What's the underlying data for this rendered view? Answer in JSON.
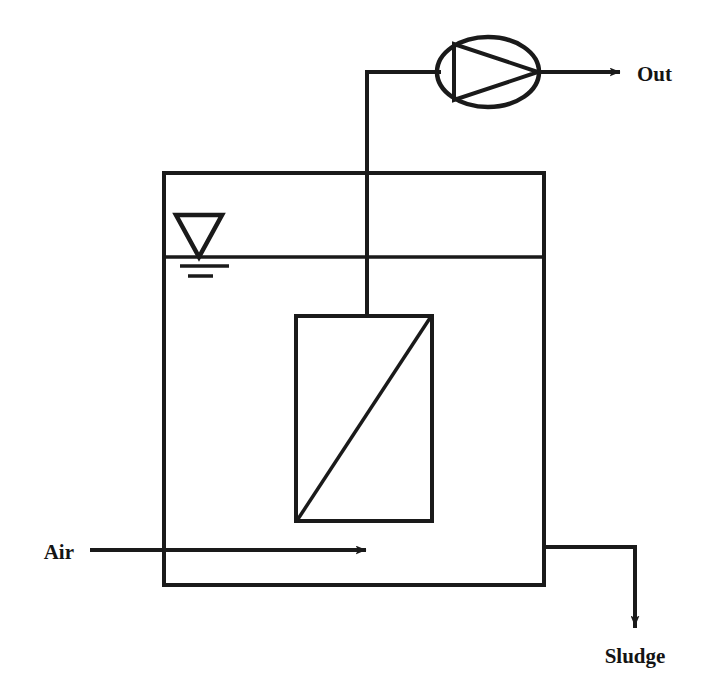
{
  "diagram": {
    "type": "process-flow-diagram",
    "stroke_color": "#1a1a1a",
    "background_color": "#ffffff",
    "labels": {
      "out": "Out",
      "air": "Air",
      "sludge": "Sludge"
    },
    "components": [
      {
        "name": "reactor-tank",
        "shape": "rectangle-open-top-walls",
        "x": 164,
        "y": 173,
        "width": 380,
        "height": 412
      },
      {
        "name": "water-level-line",
        "shape": "horizontal-line",
        "y": 257,
        "x1": 164,
        "x2": 544
      },
      {
        "name": "water-surface-symbol",
        "shape": "inverted-triangle-with-two-lines",
        "apex_x": 199,
        "apex_y": 257
      },
      {
        "name": "membrane-module",
        "shape": "rectangle-with-diagonal",
        "x": 296,
        "y": 316,
        "width": 136,
        "height": 205
      },
      {
        "name": "permeate-riser-pipe",
        "shape": "polyline-up-then-right",
        "from_x": 367,
        "from_y": 316,
        "corner_y": 72,
        "to_x": 437
      },
      {
        "name": "permeate-pump",
        "shape": "ellipse-with-inscribed-triangle",
        "cx": 488,
        "cy": 72,
        "rx": 51,
        "ry": 35
      },
      {
        "name": "outlet-arrow",
        "shape": "arrow-right",
        "x1": 540,
        "x2": 622,
        "y": 72
      },
      {
        "name": "air-inlet-arrow",
        "shape": "arrow-right",
        "x1": 90,
        "x2": 368,
        "y": 550
      },
      {
        "name": "sludge-outlet",
        "shape": "polyline-right-then-down-arrow",
        "from_x": 544,
        "from_y": 547,
        "corner_x": 635,
        "to_y": 630
      }
    ]
  }
}
